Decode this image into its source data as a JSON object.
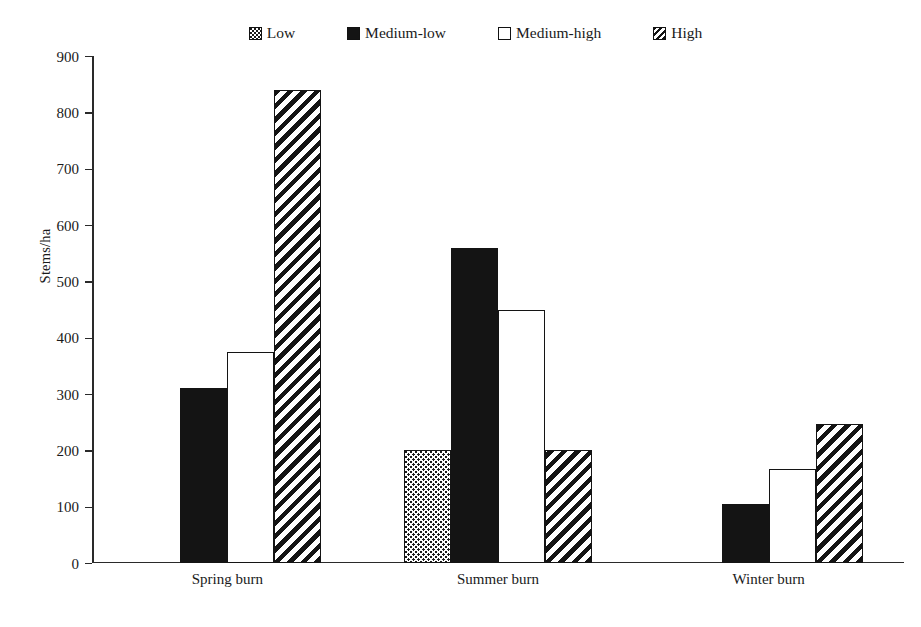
{
  "chart_data": {
    "type": "bar",
    "title": "",
    "xlabel": "",
    "ylabel": "Stems/ha",
    "ylim": [
      0,
      900
    ],
    "ytick_step": 100,
    "yticks": [
      900,
      800,
      700,
      600,
      500,
      400,
      300,
      200,
      100,
      0
    ],
    "grid": false,
    "legend_position": "top-center",
    "categories": [
      "Spring burn",
      "Summer burn",
      "Winter burn"
    ],
    "series": [
      {
        "name": "Low",
        "pattern": "stipple",
        "values": [
          0,
          200,
          0
        ]
      },
      {
        "name": "Medium-low",
        "pattern": "solid",
        "values": [
          310,
          560,
          105
        ]
      },
      {
        "name": "Medium-high",
        "pattern": "white",
        "values": [
          375,
          450,
          167
        ]
      },
      {
        "name": "High",
        "pattern": "hatch",
        "values": [
          840,
          200,
          247
        ]
      }
    ],
    "colors": {
      "ink": "#141414",
      "background": "#ffffff",
      "axis": "#2a2a2a"
    }
  },
  "legend": {
    "items": [
      {
        "label": "Low"
      },
      {
        "label": "Medium-low"
      },
      {
        "label": "Medium-high"
      },
      {
        "label": "High"
      }
    ]
  },
  "axes": {
    "y_title": "Stems/ha",
    "y_labels": [
      "900",
      "800",
      "700",
      "600",
      "500",
      "400",
      "300",
      "200",
      "100",
      "0"
    ],
    "x_labels": [
      "Spring burn",
      "Summer burn",
      "Winter burn"
    ]
  }
}
